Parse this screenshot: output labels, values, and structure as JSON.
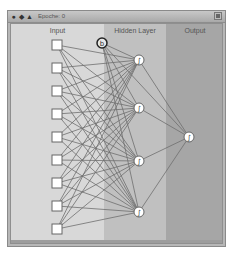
{
  "window": {
    "title": "Epoche: 0",
    "titlebar_icons": [
      "close-icon",
      "resize-icon",
      "collapse-icon"
    ],
    "zoom_button": "zoom-box-icon"
  },
  "columns": [
    {
      "label": "Input",
      "color": "#d8d8d8"
    },
    {
      "label": "Hidden Layer",
      "color": "#c0c0c0"
    },
    {
      "label": "Output",
      "color": "#a6a6a6"
    }
  ],
  "network": {
    "input_nodes": 9,
    "bias_node": {
      "label": "b"
    },
    "hidden_nodes": 4,
    "output_nodes": 1,
    "activation_glyph": "∫",
    "edge_color": "#6e6e6e"
  }
}
